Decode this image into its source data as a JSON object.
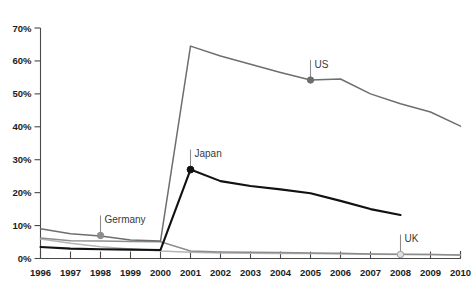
{
  "chart_data": {
    "type": "line",
    "title": "",
    "xlabel": "",
    "ylabel": "",
    "ylim": [
      0,
      70
    ],
    "xlim": [
      1996,
      2010
    ],
    "grid": false,
    "legend_position": "inline-labels",
    "y_ticks": [
      "0%",
      "10%",
      "20%",
      "30%",
      "40%",
      "50%",
      "60%",
      "70%"
    ],
    "y_tick_values": [
      0,
      10,
      20,
      30,
      40,
      50,
      60,
      70
    ],
    "x": [
      1996,
      1997,
      1998,
      1999,
      2000,
      2001,
      2002,
      2003,
      2004,
      2005,
      2006,
      2007,
      2008,
      2009,
      2010
    ],
    "x_ticks": [
      "1996",
      "1997",
      "1998",
      "1999",
      "2000",
      "2001",
      "2002",
      "2003",
      "2004",
      "2005",
      "2006",
      "2007",
      "2008",
      "2009",
      "2010"
    ],
    "series": [
      {
        "name": "US",
        "color": "#6e6e6e",
        "x": [
          1996,
          1997,
          1998,
          1999,
          2000,
          2001,
          2002,
          2003,
          2004,
          2005,
          2006,
          2007,
          2008,
          2009,
          2010
        ],
        "values": [
          9.0,
          7.5,
          6.8,
          5.6,
          5.3,
          64.5,
          61.5,
          59.0,
          56.5,
          54.2,
          54.5,
          50.0,
          47.0,
          44.5,
          40.2
        ],
        "annotation": {
          "label": "US",
          "at_x": 2005,
          "at_y": 54.2,
          "marker": "filled-dot"
        }
      },
      {
        "name": "Japan",
        "color": "#111111",
        "x": [
          1996,
          1997,
          1998,
          1999,
          2000,
          2001,
          2002,
          2003,
          2004,
          2005,
          2006,
          2007,
          2008
        ],
        "values": [
          3.5,
          3.0,
          2.8,
          2.7,
          2.6,
          27.0,
          23.5,
          22.0,
          21.0,
          19.8,
          17.5,
          15.0,
          13.2
        ],
        "annotation": {
          "label": "Japan",
          "at_x": 2001,
          "at_y": 27.0,
          "marker": "filled-dot"
        }
      },
      {
        "name": "Germany",
        "color": "#8d8d8d",
        "x": [
          1996,
          1997,
          1998,
          1999,
          2000,
          2001,
          2002,
          2003,
          2004,
          2005,
          2006,
          2007,
          2008,
          2009,
          2010
        ],
        "values": [
          6.2,
          5.4,
          5.3,
          5.2,
          5.1,
          2.3,
          2.0,
          1.9,
          1.8,
          1.7,
          1.6,
          1.4,
          1.3,
          1.2,
          1.1
        ],
        "annotation": {
          "label": "Germany",
          "at_x": 1998,
          "at_y": 7.0,
          "marker": "filled-dot"
        }
      },
      {
        "name": "UK",
        "color": "#b5b5b5",
        "x": [
          1996,
          1997,
          1998,
          1999,
          2000,
          2001,
          2002,
          2003,
          2004,
          2005,
          2006,
          2007,
          2008,
          2009,
          2010
        ],
        "values": [
          5.9,
          4.6,
          3.6,
          2.9,
          2.3,
          1.9,
          1.7,
          1.6,
          1.5,
          1.5,
          1.4,
          1.3,
          1.2,
          1.2,
          1.1
        ],
        "annotation": {
          "label": "UK",
          "at_x": 2008,
          "at_y": 1.2,
          "marker": "hollow-dot"
        }
      }
    ]
  },
  "labels": {
    "us": "US",
    "japan": "Japan",
    "germany": "Germany",
    "uk": "UK"
  },
  "colors": {
    "us": "#6e6e6e",
    "japan": "#111111",
    "germany": "#8d8d8d",
    "uk": "#b5b5b5",
    "axis": "#4a4a4a",
    "text": "#1c1c1c",
    "background": "#ffffff"
  }
}
